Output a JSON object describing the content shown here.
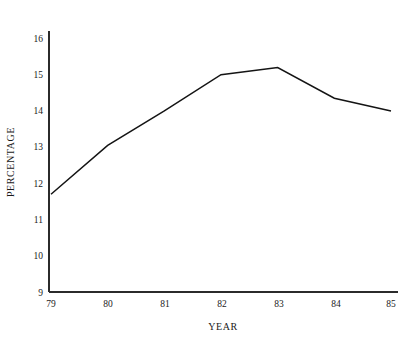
{
  "chart_data": {
    "type": "line",
    "title": "",
    "subtitle": "",
    "xlabel": "YEAR",
    "ylabel": "PERCENTAGE",
    "x": [
      79,
      80,
      81,
      82,
      83,
      84,
      85
    ],
    "categories": [
      "79",
      "80",
      "81",
      "82",
      "83",
      "84",
      "85"
    ],
    "values": [
      11.7,
      13.05,
      14.0,
      15.0,
      15.2,
      14.35,
      14.0
    ],
    "series": [
      {
        "name": "percentage",
        "values": [
          11.7,
          13.05,
          14.0,
          15.0,
          15.2,
          14.35,
          14.0
        ]
      }
    ],
    "xlim": [
      79,
      85
    ],
    "ylim": [
      9,
      16
    ],
    "y_ticks": [
      9,
      10,
      11,
      12,
      13,
      14,
      15,
      16
    ],
    "y_tick_labels": [
      "9",
      "10",
      "11",
      "12",
      "13",
      "14",
      "15",
      "16"
    ],
    "x_ticks": [
      79,
      80,
      81,
      82,
      83,
      84,
      85
    ],
    "x_tick_labels": [
      "79",
      "80",
      "81",
      "82",
      "83",
      "84",
      "85"
    ],
    "grid": false,
    "legend": false,
    "legend_position": "none",
    "line_color": "#141414",
    "axis_color": "#2b2b2b",
    "background_color": "#ffffff",
    "annotations": []
  },
  "axes": {
    "x_title": "YEAR",
    "y_title": "PERCENTAGE"
  }
}
